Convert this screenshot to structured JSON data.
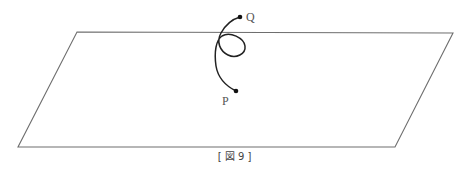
{
  "figure": {
    "caption": "[ 図 9 ]",
    "labels": {
      "start_point": "P",
      "end_point": "Q"
    },
    "colors": {
      "plane_edge": "#6e6e6e",
      "curve": "#222222",
      "label": "#555555"
    },
    "plane": {
      "shape": "parallelogram",
      "corners": [
        [
          77,
          32
        ],
        [
          453,
          33
        ],
        [
          395,
          147
        ],
        [
          18,
          147
        ]
      ]
    },
    "curve": {
      "description": "curve from P looping once and passing through the plane up to Q",
      "P": [
        236,
        91
      ],
      "Q": [
        240,
        17
      ]
    }
  }
}
